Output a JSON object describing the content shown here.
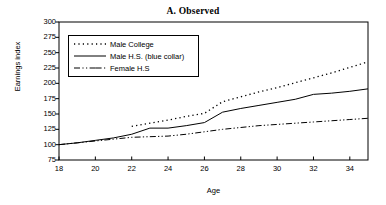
{
  "chart_data": {
    "type": "line",
    "title": "A.  Observed",
    "xlabel": "Age",
    "ylabel": "Earnings index",
    "xlim": [
      18,
      35
    ],
    "ylim": [
      75,
      300
    ],
    "ytick_step": 25,
    "xtick_step": 2,
    "xticks": [
      18,
      20,
      22,
      24,
      26,
      28,
      30,
      32,
      34
    ],
    "yticks": [
      75,
      100,
      125,
      150,
      175,
      200,
      225,
      250,
      275,
      300
    ],
    "grid": false,
    "legend_position": "upper-left-inside",
    "series": [
      {
        "name": "Male College",
        "style": "dotted",
        "color": "#000000",
        "x": [
          22,
          23,
          24,
          25,
          26,
          27,
          28,
          29,
          30,
          31,
          32,
          33,
          34,
          35
        ],
        "values": [
          130,
          135,
          140,
          146,
          151,
          170,
          178,
          186,
          193,
          201,
          209,
          217,
          226,
          235
        ]
      },
      {
        "name": "Male H.S. (blue collar)",
        "style": "solid",
        "color": "#000000",
        "x": [
          18,
          19,
          20,
          21,
          22,
          23,
          24,
          25,
          26,
          27,
          28,
          29,
          30,
          31,
          32,
          33,
          34,
          35
        ],
        "values": [
          100,
          103,
          107,
          111,
          117,
          127,
          127,
          131,
          136,
          153,
          159,
          164,
          169,
          174,
          182,
          184,
          187,
          191
        ]
      },
      {
        "name": "Female H.S",
        "style": "dash-dot",
        "color": "#000000",
        "x": [
          18,
          19,
          20,
          21,
          22,
          23,
          24,
          25,
          26,
          27,
          28,
          29,
          30,
          31,
          32,
          33,
          34,
          35
        ],
        "values": [
          100,
          103,
          106,
          109,
          112,
          113,
          114,
          117,
          121,
          125,
          128,
          131,
          133,
          135,
          137,
          139,
          141,
          143
        ]
      }
    ]
  },
  "axis": {
    "ylabel": "Earnings index",
    "xlabel": "Age"
  }
}
